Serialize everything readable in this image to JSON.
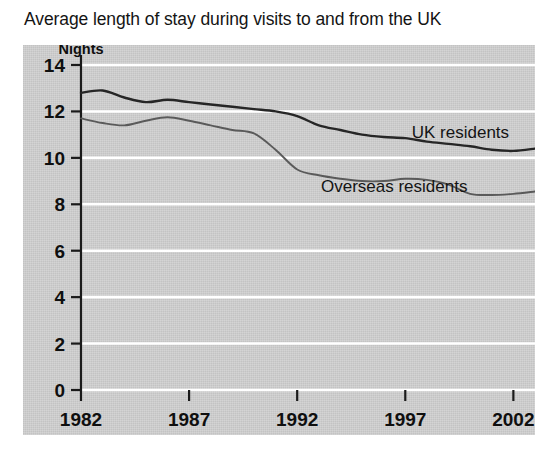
{
  "chart_data": {
    "type": "line",
    "title": "Average length of stay during visits to and from the UK",
    "xlabel": "",
    "ylabel": "Nights",
    "ylabel_text": "Nights",
    "xlim": [
      1982,
      2003
    ],
    "ylim": [
      0,
      14
    ],
    "grid": true,
    "legend_position": "inline-annotation",
    "yticks": [
      "0",
      "2",
      "4",
      "6",
      "8",
      "10",
      "12",
      "14"
    ],
    "ytick_values": [
      0,
      2,
      4,
      6,
      8,
      10,
      12,
      14
    ],
    "xticks": [
      "1982",
      "1987",
      "1992",
      "1997",
      "2002"
    ],
    "xtick_values": [
      1982,
      1987,
      1992,
      1997,
      2002
    ],
    "x": [
      1982,
      1983,
      1984,
      1985,
      1986,
      1987,
      1988,
      1989,
      1990,
      1991,
      1992,
      1993,
      1994,
      1995,
      1996,
      1997,
      1998,
      1999,
      2000,
      2001,
      2002,
      2003
    ],
    "series": [
      {
        "name": "UK residents",
        "color": "#262626",
        "label_x": 1997.3,
        "label_y": 10.85,
        "values": [
          12.8,
          12.9,
          12.6,
          12.4,
          12.5,
          12.4,
          12.3,
          12.2,
          12.1,
          12.0,
          11.8,
          11.4,
          11.2,
          11.0,
          10.9,
          10.85,
          10.7,
          10.6,
          10.5,
          10.35,
          10.3,
          10.4
        ]
      },
      {
        "name": "Overseas residents",
        "color": "#5a5a5a",
        "label_x": 1993.1,
        "label_y": 8.55,
        "values": [
          11.7,
          11.5,
          11.4,
          11.6,
          11.75,
          11.6,
          11.4,
          11.2,
          11.05,
          10.35,
          9.5,
          9.25,
          9.1,
          9.0,
          9.0,
          9.1,
          9.05,
          8.85,
          8.45,
          8.4,
          8.45,
          8.55
        ]
      }
    ]
  },
  "panel": {
    "background_color": "#cccccc",
    "gridline_color": "#ffffff",
    "axis_color": "#1a1a1a"
  }
}
